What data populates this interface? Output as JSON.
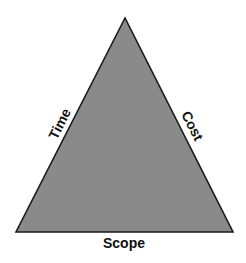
{
  "diagram": {
    "colors": {
      "fill": "#8a8a8a",
      "stroke": "#1a1a1a",
      "text": "#111111",
      "background": "#ffffff"
    },
    "triangle": {
      "apex": [
        125,
        18
      ],
      "base_left": [
        16,
        232
      ],
      "base_right": [
        233,
        232
      ]
    },
    "labels": {
      "left_side": "Time",
      "right_side": "Cost",
      "base": "Scope"
    }
  }
}
